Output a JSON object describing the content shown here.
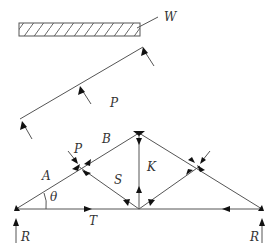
{
  "diagram": {
    "colors": {
      "line": "#555555",
      "arrow": "#111111",
      "text": "#333333",
      "background": "#ffffff"
    },
    "labels": {
      "weight": "W",
      "distributed_load": "P",
      "joint_load": "P",
      "member_a": "A",
      "member_b": "B",
      "member_s": "S",
      "member_k": "K",
      "member_t": "T",
      "angle": "θ",
      "reaction_left": "R",
      "reaction_right": "R"
    }
  }
}
